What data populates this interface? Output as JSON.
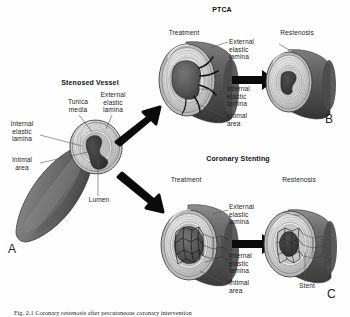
{
  "figure": {
    "panels": {
      "a": {
        "letter": "A",
        "title": "Stenosed Vessel",
        "labels": {
          "tunica_media": "Tunica\nmedia",
          "external_elastic_lamina": "External\nelastic\nlamina",
          "internal_elastic_lamina": "Internal\nelastic\nlamina",
          "intimal_area": "Intimal\narea",
          "lumen": "Lumen"
        }
      },
      "b": {
        "letter": "B",
        "title": "PTCA",
        "stage_treatment": "Treatment",
        "stage_restenosis": "Restenosis",
        "labels": {
          "external_elastic_lamina": "External\nelastic\nlamina",
          "internal_elastic_lamina": "Internal\nelastic\nlamina",
          "intimal_area": "Intimal\narea"
        }
      },
      "c": {
        "letter": "C",
        "title": "Coronary Stenting",
        "stage_treatment": "Treatment",
        "stage_restenosis": "Restenosis",
        "labels": {
          "external_elastic_lamina": "External\nelastic\nlamina",
          "internal_elastic_lamina": "Internal\nelastic\nlamina",
          "intimal_area": "Intimal\narea",
          "stent": "Stent"
        }
      }
    },
    "caption": "Fig. 2.1 Coronary restenosis after percutaneous coronary intervention",
    "colors": {
      "vessel_outer": "#6e6e6e",
      "vessel_outer_dark": "#4a4a4a",
      "media_light": "#d8d8d8",
      "lamina_white": "#efefef",
      "lumen_dark": "#5a5a5a",
      "plaque": "#3a3a3a",
      "arrow": "#0b0b0b",
      "leader": "#555555",
      "text": "#1d1d1d",
      "background": "#ffffff"
    }
  }
}
